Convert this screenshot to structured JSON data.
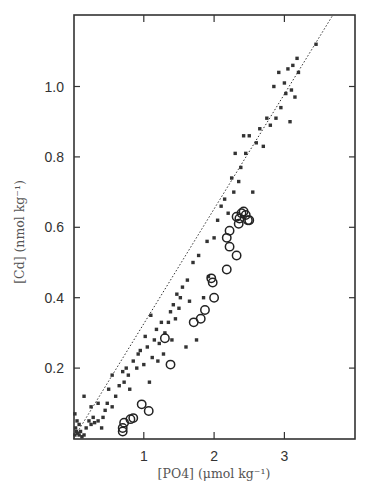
{
  "chart_data": {
    "type": "scatter",
    "title": "",
    "xlabel": "[PO4] (μmol kg⁻¹)",
    "ylabel": "[Cd] (nmol kg⁻¹)",
    "xlim": [
      0,
      4.0
    ],
    "ylim": [
      0,
      1.2
    ],
    "x_ticks": [
      1,
      2,
      3
    ],
    "x_tick_labels": [
      "1",
      "2",
      "3"
    ],
    "y_ticks": [
      0.2,
      0.4,
      0.6,
      0.8,
      1.0
    ],
    "y_tick_labels": [
      "0.2",
      "0.4",
      "0.6",
      "0.8",
      "1.0"
    ],
    "grid": false,
    "legend": null,
    "series": [
      {
        "name": "filled squares",
        "marker": "square",
        "color": "#333333",
        "points": [
          [
            0.02,
            0.01
          ],
          [
            0.04,
            0.02
          ],
          [
            0.06,
            0.015
          ],
          [
            0.03,
            0.03
          ],
          [
            0.08,
            0.01
          ],
          [
            0.1,
            0.02
          ],
          [
            0.12,
            0.005
          ],
          [
            0.15,
            0.01
          ],
          [
            0.05,
            0.05
          ],
          [
            0.02,
            0.07
          ],
          [
            0.08,
            0.04
          ],
          [
            0.18,
            0.03
          ],
          [
            0.22,
            0.05
          ],
          [
            0.25,
            0.04
          ],
          [
            0.28,
            0.06
          ],
          [
            0.3,
            0.045
          ],
          [
            0.35,
            0.05
          ],
          [
            0.4,
            0.03
          ],
          [
            0.42,
            0.06
          ],
          [
            0.45,
            0.08
          ],
          [
            0.15,
            0.12
          ],
          [
            0.25,
            0.09
          ],
          [
            0.35,
            0.1
          ],
          [
            0.48,
            0.1
          ],
          [
            0.5,
            0.14
          ],
          [
            0.55,
            0.09
          ],
          [
            0.55,
            0.18
          ],
          [
            0.6,
            0.12
          ],
          [
            0.65,
            0.15
          ],
          [
            0.7,
            0.19
          ],
          [
            0.72,
            0.16
          ],
          [
            0.75,
            0.2
          ],
          [
            0.78,
            0.18
          ],
          [
            0.8,
            0.14
          ],
          [
            0.85,
            0.22
          ],
          [
            0.9,
            0.2
          ],
          [
            0.92,
            0.24
          ],
          [
            0.95,
            0.25
          ],
          [
            1.0,
            0.21
          ],
          [
            1.02,
            0.29
          ],
          [
            1.05,
            0.26
          ],
          [
            1.08,
            0.16
          ],
          [
            1.1,
            0.35
          ],
          [
            1.12,
            0.23
          ],
          [
            1.15,
            0.28
          ],
          [
            1.18,
            0.31
          ],
          [
            1.2,
            0.22
          ],
          [
            1.22,
            0.27
          ],
          [
            1.25,
            0.33
          ],
          [
            1.28,
            0.24
          ],
          [
            1.3,
            0.3
          ],
          [
            1.35,
            0.33
          ],
          [
            1.38,
            0.36
          ],
          [
            1.4,
            0.28
          ],
          [
            1.42,
            0.38
          ],
          [
            1.45,
            0.34
          ],
          [
            1.47,
            0.41
          ],
          [
            1.5,
            0.37
          ],
          [
            1.52,
            0.4
          ],
          [
            1.55,
            0.43
          ],
          [
            1.6,
            0.26
          ],
          [
            1.62,
            0.45
          ],
          [
            1.65,
            0.39
          ],
          [
            1.7,
            0.5
          ],
          [
            1.75,
            0.28
          ],
          [
            1.78,
            0.52
          ],
          [
            1.85,
            0.4
          ],
          [
            1.9,
            0.56
          ],
          [
            1.92,
            0.46
          ],
          [
            2.0,
            0.57
          ],
          [
            2.05,
            0.62
          ],
          [
            2.1,
            0.66
          ],
          [
            2.15,
            0.68
          ],
          [
            2.2,
            0.64
          ],
          [
            2.25,
            0.74
          ],
          [
            2.28,
            0.7
          ],
          [
            2.3,
            0.81
          ],
          [
            2.35,
            0.73
          ],
          [
            2.38,
            0.77
          ],
          [
            2.42,
            0.86
          ],
          [
            2.45,
            0.81
          ],
          [
            2.5,
            0.86
          ],
          [
            2.55,
            0.7
          ],
          [
            2.6,
            0.84
          ],
          [
            2.65,
            0.88
          ],
          [
            2.7,
            0.83
          ],
          [
            2.75,
            0.91
          ],
          [
            2.8,
            0.89
          ],
          [
            2.85,
            1.0
          ],
          [
            2.88,
            0.91
          ],
          [
            2.92,
            1.04
          ],
          [
            2.95,
            0.94
          ],
          [
            3.0,
            1.01
          ],
          [
            3.02,
            0.98
          ],
          [
            3.05,
            1.05
          ],
          [
            3.08,
            0.9
          ],
          [
            3.1,
            0.99
          ],
          [
            3.12,
            1.06
          ],
          [
            3.15,
            0.97
          ],
          [
            3.18,
            1.08
          ],
          [
            3.2,
            1.04
          ],
          [
            3.45,
            1.12
          ]
        ]
      },
      {
        "name": "open circles",
        "marker": "circle-open",
        "color": "#222222",
        "points": [
          [
            0.7,
            0.02
          ],
          [
            0.7,
            0.03
          ],
          [
            0.72,
            0.045
          ],
          [
            0.81,
            0.055
          ],
          [
            0.85,
            0.058
          ],
          [
            0.97,
            0.097
          ],
          [
            1.07,
            0.078
          ],
          [
            1.3,
            0.285
          ],
          [
            1.38,
            0.21
          ],
          [
            1.71,
            0.33
          ],
          [
            1.81,
            0.34
          ],
          [
            1.87,
            0.365
          ],
          [
            1.96,
            0.455
          ],
          [
            1.98,
            0.443
          ],
          [
            2.0,
            0.4
          ],
          [
            2.18,
            0.48
          ],
          [
            2.18,
            0.57
          ],
          [
            2.22,
            0.545
          ],
          [
            2.22,
            0.59
          ],
          [
            2.32,
            0.52
          ],
          [
            2.32,
            0.63
          ],
          [
            2.35,
            0.61
          ],
          [
            2.36,
            0.625
          ],
          [
            2.39,
            0.64
          ],
          [
            2.42,
            0.645
          ],
          [
            2.45,
            0.635
          ],
          [
            2.48,
            0.62
          ],
          [
            2.5,
            0.62
          ]
        ]
      },
      {
        "name": "regression line",
        "type": "line",
        "style": "dotted",
        "color": "#333333",
        "points": [
          [
            0.0,
            0.0
          ],
          [
            3.68,
            1.2
          ]
        ]
      }
    ]
  }
}
